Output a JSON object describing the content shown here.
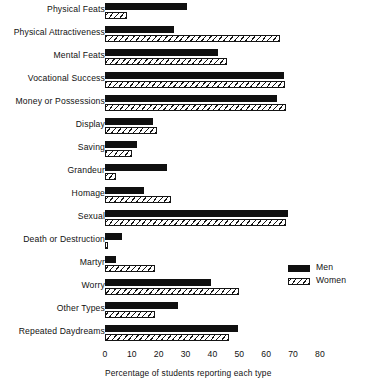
{
  "chart_data": {
    "type": "bar",
    "orientation": "horizontal",
    "title": "",
    "subtitle": "",
    "xlabel": "Percentage of students reporting each type",
    "ylabel": "",
    "xlim": [
      0,
      80
    ],
    "xticks": [
      0,
      10,
      20,
      30,
      40,
      50,
      60,
      70,
      80
    ],
    "xtick_labels": [
      "0",
      "10",
      "20",
      "30",
      "40",
      "50",
      "60",
      "70",
      "80"
    ],
    "grid": false,
    "legend_position": "right-middle",
    "categories": [
      "Physical Feats",
      "Physical Attractiveness",
      "Mental Feats",
      "Vocational Success",
      "Money or Possessions",
      "Display",
      "Saving",
      "Grandeur",
      "Homage",
      "Sexual",
      "Death or Destruction",
      "Martyr",
      "Worry",
      "Other Types",
      "Repeated Daydreams"
    ],
    "series": [
      {
        "name": "Men",
        "fill": "solid-black",
        "color": "#101010",
        "values": [
          30.5,
          25.5,
          42,
          66.5,
          64,
          18,
          12,
          23,
          14.5,
          68,
          6.5,
          4,
          39.5,
          27,
          49.5
        ]
      },
      {
        "name": "Women",
        "fill": "hatched",
        "color": "#ffffff",
        "values": [
          8,
          65,
          45.5,
          67,
          67.5,
          19.5,
          10,
          4,
          24.5,
          67.5,
          1,
          18.5,
          50,
          18.5,
          46
        ]
      }
    ]
  },
  "legend": {
    "items": [
      {
        "label": "Men",
        "style": "men"
      },
      {
        "label": "Women",
        "style": "women"
      }
    ]
  }
}
